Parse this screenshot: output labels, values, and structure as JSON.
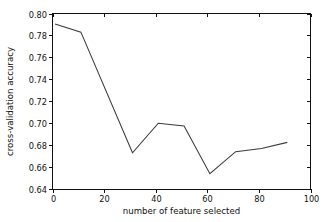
{
  "figure": {
    "background_color": "#ffffff",
    "line_color": "#3b3b3b",
    "axis_color": "#111111"
  },
  "chart_data": {
    "type": "line",
    "title": "",
    "xlabel": "number of feature selected",
    "ylabel": "cross-validation accuracy",
    "xlim": [
      0,
      100
    ],
    "ylim": [
      0.64,
      0.8
    ],
    "grid": false,
    "legend": null,
    "xticks": [
      0,
      20,
      40,
      60,
      80,
      100
    ],
    "xtick_labels": [
      "0",
      "20",
      "40",
      "60",
      "80",
      "100"
    ],
    "yticks": [
      0.64,
      0.66,
      0.68,
      0.7,
      0.72,
      0.74,
      0.76,
      0.78,
      0.8
    ],
    "ytick_labels": [
      "0.64",
      "0.66",
      "0.68",
      "0.70",
      "0.72",
      "0.74",
      "0.76",
      "0.78",
      "0.80"
    ],
    "x": [
      1,
      11,
      31,
      41,
      51,
      61,
      71,
      81,
      91
    ],
    "values": [
      0.7905,
      0.783,
      0.673,
      0.7,
      0.6975,
      0.654,
      0.674,
      0.677,
      0.6825
    ],
    "series": [
      {
        "name": "cross-validation accuracy",
        "x": [
          1,
          11,
          31,
          41,
          51,
          61,
          71,
          81,
          91
        ],
        "values": [
          0.7905,
          0.783,
          0.673,
          0.7,
          0.6975,
          0.654,
          0.674,
          0.677,
          0.6825
        ]
      }
    ]
  }
}
